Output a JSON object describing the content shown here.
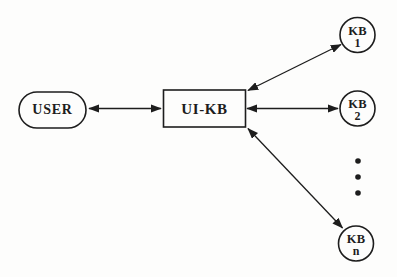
{
  "diagram": {
    "type": "node-link-diagram",
    "nodes": {
      "user": {
        "label": "USER",
        "shape": "stadium"
      },
      "uikb": {
        "label": "UI-KB",
        "shape": "rectangle"
      },
      "kb1": {
        "label": "KB",
        "sub": "1",
        "shape": "circle"
      },
      "kb2": {
        "label": "KB",
        "sub": "2",
        "shape": "circle"
      },
      "kbn": {
        "label": "KB",
        "sub": "n",
        "shape": "circle"
      }
    },
    "ellipsis": {
      "style": "vertical-dots",
      "count": 3
    },
    "edges": [
      {
        "from": "USER",
        "to": "UI-KB",
        "style": "double-arrow"
      },
      {
        "from": "UI-KB",
        "to": "KB 1",
        "style": "double-arrow"
      },
      {
        "from": "UI-KB",
        "to": "KB 2",
        "style": "double-arrow"
      },
      {
        "from": "UI-KB",
        "to": "KB n",
        "style": "double-arrow"
      }
    ],
    "colors": {
      "ink": "#1d1d1d",
      "background": "#fdfdfc"
    }
  }
}
